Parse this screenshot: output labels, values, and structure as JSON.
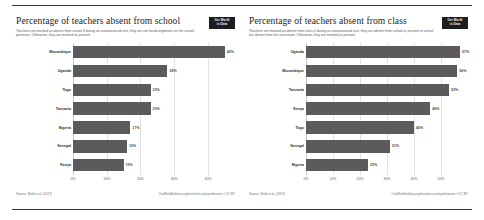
{
  "page": {
    "background_color": "#ffffff",
    "rule_color": "#3a3a3a",
    "bar_color": "#5b5b5b",
    "grid_color": "#e3e3e3"
  },
  "panels": [
    {
      "title": "Percentage of teachers absent from school",
      "subtitle": "Teachers are marked as absent from school if during an unannounced visit, they are not found anywhere on the school premises. Otherwise, they are marked as present.",
      "badge_line1": "Our World",
      "badge_line2": "in Data",
      "source": "Source: Bold et al. (2017)",
      "attribution": "OurWorldInData.org/teachers-and-professors • CC BY",
      "chart_data": {
        "type": "bar",
        "orientation": "horizontal",
        "title": "Percentage of teachers absent from school",
        "xlabel": "",
        "ylabel": "",
        "xlim": [
          0,
          48
        ],
        "grid": true,
        "legend": "none",
        "ticks": [
          "0%",
          "10%",
          "20%",
          "30%",
          "40%"
        ],
        "tick_values": [
          0,
          10,
          20,
          30,
          40
        ],
        "categories": [
          "Mozambique",
          "Uganda",
          "Togo",
          "Tanzania",
          "Nigeria",
          "Senegal",
          "Kenya"
        ],
        "values": [
          45,
          28,
          23,
          23,
          17,
          16,
          15
        ],
        "value_labels": [
          "45%",
          "28%",
          "23%",
          "23%",
          "17%",
          "16%",
          "15%"
        ]
      }
    },
    {
      "title": "Percentage of teachers absent from class",
      "subtitle": "Teachers are marked as absent from class if during an unannounced visit, they are absent from school or present at school but absent from the classroom. Otherwise, they are marked as present.",
      "badge_line1": "Our World",
      "badge_line2": "in Data",
      "source": "Source: Bold et al. (2017)",
      "attribution": "OurWorldInData.org/teachers-and-professors • CC BY",
      "chart_data": {
        "type": "bar",
        "orientation": "horizontal",
        "title": "Percentage of teachers absent from class",
        "xlabel": "",
        "ylabel": "",
        "xlim": [
          0,
          60
        ],
        "grid": true,
        "legend": "none",
        "ticks": [
          "0%",
          "10%",
          "20%",
          "30%",
          "40%",
          "50%"
        ],
        "tick_values": [
          0,
          10,
          20,
          30,
          40,
          50
        ],
        "categories": [
          "Uganda",
          "Mozambique",
          "Tanzania",
          "Kenya",
          "Togo",
          "Senegal",
          "Nigeria"
        ],
        "values": [
          57,
          56,
          53,
          46,
          40,
          31,
          23
        ],
        "value_labels": [
          "57%",
          "56%",
          "53%",
          "46%",
          "40%",
          "31%",
          "23%"
        ]
      }
    }
  ]
}
